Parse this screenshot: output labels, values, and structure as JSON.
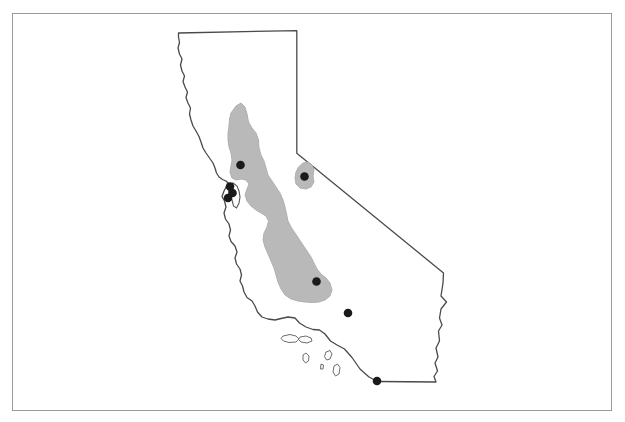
{
  "figure": {
    "type": "map",
    "title": "",
    "caption": "",
    "region": "California",
    "width": 625,
    "height": 422,
    "background_color": "#ffffff"
  },
  "frame": {
    "name": "figure-border",
    "x": 12,
    "y": 13,
    "width": 600,
    "height": 398,
    "stroke_color": "#9a9a9a",
    "stroke_width": 1,
    "fill": "#ffffff"
  },
  "map": {
    "state_outline": {
      "label": "California state boundary",
      "stroke_color": "#4a4a4a",
      "stroke_width": 1.3,
      "fill": "#ffffff",
      "path": "M 178.5 33.0 L 296.8 30.6 L 296.8 153.2 L 443.5 273.0 L 443.0 283.0 L 441.0 296.0 L 446.5 302.0 L 441.0 309.0 L 439.5 318.0 L 442.0 325.0 L 438.5 331.0 L 439.5 341.0 L 436.0 348.0 L 438.0 357.0 L 435.0 363.0 L 437.5 371.0 L 434.0 376.5 L 436.0 382.0 L 377.5 381.5 L 369.0 377.0 L 360.0 369.0 L 352.0 357.5 L 344.5 349.0 L 337.0 345.0 L 330.5 341.0 L 325.0 334.0 L 319.5 330.0 L 313.0 329.5 L 306.0 327.0 L 299.5 323.0 L 295.0 318.0 L 288.0 317.0 L 281.0 318.5 L 275.0 320.0 L 268.0 319.0 L 262.0 317.0 L 257.5 312.0 L 255.0 306.0 L 252.0 301.0 L 247.0 297.5 L 244.0 292.0 L 242.5 286.0 L 240.0 281.0 L 241.5 275.0 L 240.0 269.0 L 236.5 264.0 L 235.0 258.0 L 237.0 252.0 L 235.0 246.0 L 231.0 241.5 L 229.0 236.0 L 230.5 230.0 L 229.0 224.0 L 225.5 219.0 L 224.0 213.0 L 226.0 207.0 L 224.5 201.0 L 222.0 196.5 L 224.0 191.0 L 226.5 186.5 L 229.0 184.0 L 226.0 181.0 L 222.5 179.5 L 219.0 177.0 L 216.5 173.0 L 215.0 168.0 L 213.0 163.0 L 209.5 158.0 L 206.0 153.0 L 203.0 148.0 L 201.0 142.0 L 199.0 136.5 L 196.0 131.0 L 193.0 126.0 L 191.0 120.0 L 189.5 114.0 L 190.5 108.0 L 188.0 103.0 L 186.0 97.5 L 187.5 92.0 L 185.0 87.0 L 183.0 81.5 L 184.5 76.0 L 182.0 71.0 L 180.5 65.0 L 182.0 59.0 L 179.5 54.0 L 178.0 48.0 L 179.5 42.5 L 178.5 37.0 Z"
    },
    "shaded_region": {
      "label": "Central Valley shaded area",
      "fill_color": "#b9b9b9",
      "stroke_color": "#b0b0b0",
      "paths": [
        "M 231.0 113.0 L 236.0 106.0 L 241.0 103.0 L 245.0 107.0 L 247.0 114.0 L 248.5 122.0 L 252.0 128.0 L 256.0 133.0 L 258.5 140.0 L 259.0 148.0 L 261.0 155.0 L 264.0 161.0 L 266.0 168.0 L 268.0 175.0 L 272.0 181.0 L 276.0 187.0 L 280.0 193.0 L 283.0 200.0 L 285.0 207.0 L 286.5 214.0 L 288.0 221.0 L 291.0 227.0 L 295.0 233.0 L 299.0 239.0 L 303.0 245.0 L 307.0 251.0 L 311.0 257.0 L 314.0 263.0 L 317.0 269.0 L 321.0 274.0 L 326.0 278.0 L 330.0 283.0 L 332.0 290.0 L 330.0 296.0 L 325.0 300.0 L 319.0 302.0 L 312.0 302.5 L 305.0 302.0 L 298.0 301.0 L 291.0 299.0 L 285.0 295.0 L 281.0 289.0 L 278.0 282.0 L 276.0 275.0 L 274.0 268.0 L 271.0 261.0 L 268.0 254.0 L 265.0 247.0 L 263.0 240.0 L 264.0 233.0 L 267.0 227.0 L 268.5 221.0 L 266.0 216.0 L 261.0 213.0 L 256.0 210.0 L 251.0 206.0 L 247.0 201.0 L 245.0 195.0 L 247.0 189.0 L 249.0 184.0 L 246.0 180.0 L 241.0 179.0 L 236.0 180.0 L 232.0 178.0 L 230.0 172.0 L 231.0 166.0 L 232.0 160.0 L 231.0 153.0 L 229.0 147.0 L 228.0 140.0 L 228.0 133.0 L 229.0 126.0 L 229.5 119.0 Z",
        "M 303.0 163.0 L 308.0 162.0 L 312.0 165.0 L 314.0 170.0 L 313.0 176.0 L 314.0 182.0 L 311.0 187.0 L 306.0 189.0 L 300.0 188.0 L 296.0 184.0 L 295.0 178.0 L 296.0 172.0 L 298.5 167.0 Z"
      ]
    },
    "islands": {
      "label": "Channel Islands",
      "fill_color": "#fbfbfb",
      "stroke_color": "#6e6e6e",
      "paths": [
        "M 283.0 336.0 L 290.0 334.5 L 296.0 336.0 L 299.0 339.0 L 296.0 342.0 L 289.0 342.5 L 283.5 341.0 L 281.0 338.5 Z",
        "M 300.0 337.0 L 306.0 336.0 L 311.0 338.0 L 312.0 341.0 L 307.0 343.0 L 301.0 342.0 L 298.5 339.5 Z",
        "M 303.0 355.0 L 306.0 353.0 L 309.0 356.0 L 308.5 361.0 L 305.5 363.0 L 303.0 360.0 Z",
        "M 326.0 352.0 L 330.0 350.5 L 332.0 354.0 L 330.0 359.0 L 326.5 360.0 L 324.5 356.5 Z",
        "M 334.0 366.0 L 337.5 364.0 L 340.0 367.5 L 339.0 374.0 L 335.5 376.0 L 333.0 372.0 Z",
        "M 321.0 364.0 L 323.5 365.0 L 323.0 369.0 L 320.5 369.0 Z"
      ]
    },
    "bay": {
      "label": "San Francisco Bay",
      "fill_color": "#ffffff",
      "stroke_color": "#555555",
      "path": "M 229.0 185.0 L 233.0 183.0 L 237.0 186.0 L 239.0 191.0 L 240.0 197.0 L 239.0 203.0 L 236.5 208.0 L 233.5 206.0 L 232.0 200.0 L 230.0 194.0 L 228.0 189.0 Z"
    },
    "points": {
      "label": "Sample site locations",
      "fill_color": "#1a1a1a",
      "radius": 4.3,
      "items": [
        {
          "name": "point-north-valley",
          "x": 240.5,
          "y": 165.0
        },
        {
          "name": "point-bay-area-a",
          "x": 230.0,
          "y": 186.5
        },
        {
          "name": "point-bay-area-b",
          "x": 232.5,
          "y": 193.0
        },
        {
          "name": "point-bay-area-c",
          "x": 228.0,
          "y": 198.0
        },
        {
          "name": "point-eastern-sierra",
          "x": 304.5,
          "y": 176.5
        },
        {
          "name": "point-south-valley",
          "x": 316.5,
          "y": 281.5
        },
        {
          "name": "point-southern-interior",
          "x": 348.0,
          "y": 313.0
        },
        {
          "name": "point-south-border",
          "x": 377.0,
          "y": 381.0
        }
      ]
    }
  }
}
